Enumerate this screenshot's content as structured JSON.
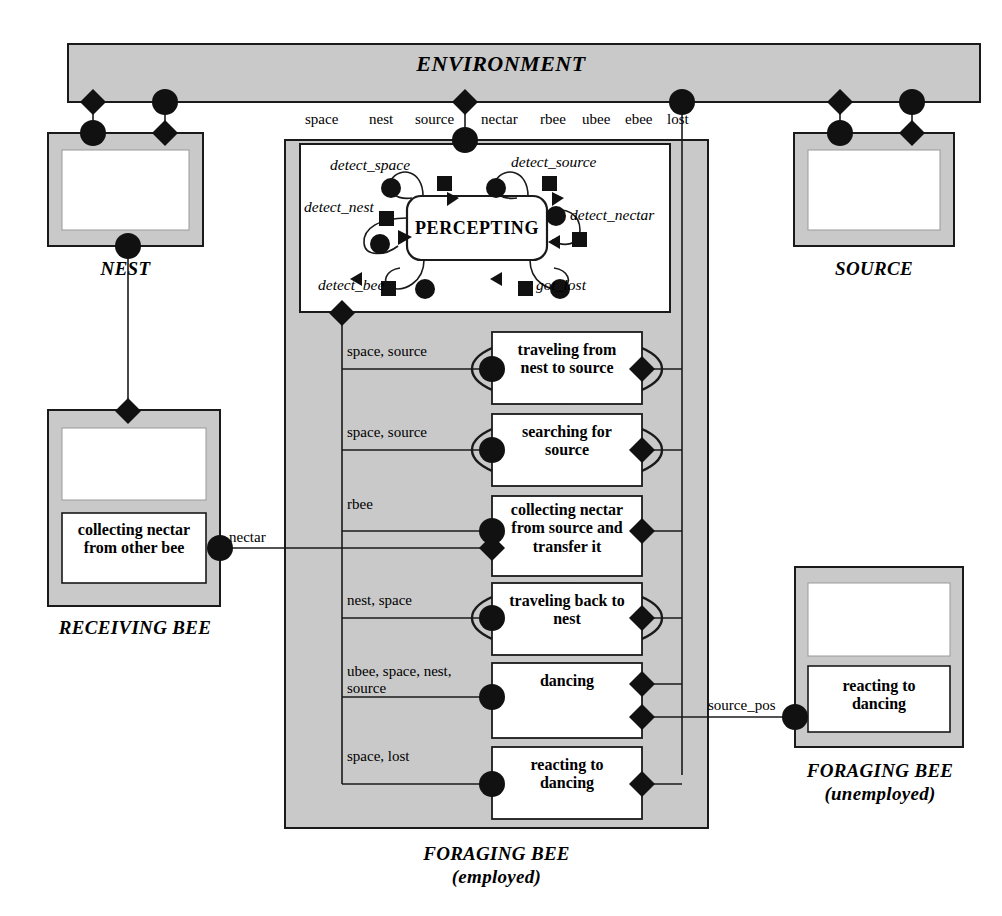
{
  "diagram": {
    "colors": {
      "gray_fill": "#c9c9c9",
      "stroke": "#1a1a1a",
      "white": "#ffffff"
    }
  },
  "environment": {
    "title": "ENVIRONMENT"
  },
  "ports_bar": {
    "items": [
      "space",
      "nest",
      "source",
      "nectar",
      "rbee",
      "ubee",
      "ebee",
      "lost"
    ]
  },
  "entities": {
    "nest": {
      "caption": "NEST"
    },
    "source": {
      "caption": "SOURCE"
    },
    "receiving_bee": {
      "caption": "RECEIVING BEE",
      "activity": "collecting nectar\nfrom other bee"
    },
    "foraging_bee_employed": {
      "caption_line1": "FORAGING BEE",
      "caption_line2": "(employed)"
    },
    "foraging_bee_unemployed": {
      "caption_line1": "FORAGING BEE",
      "caption_line2": "(unemployed)",
      "activity": "reacting to\ndancing"
    }
  },
  "percepting": {
    "name": "PERCEPTING",
    "transitions": [
      {
        "id": "detect_space",
        "label": "detect_space"
      },
      {
        "id": "detect_source",
        "label": "detect_source"
      },
      {
        "id": "detect_nest",
        "label": "detect_nest"
      },
      {
        "id": "detect_nectar",
        "label": "detect_nectar"
      },
      {
        "id": "detect_bee",
        "label": "detect_bee"
      },
      {
        "id": "got_lost",
        "label": "got_lost"
      }
    ]
  },
  "activities": [
    {
      "id": "traveling-from-nest-to-source",
      "label": "traveling from\nnest to source",
      "inputs": "space, source",
      "elliptical": true
    },
    {
      "id": "searching-for-source",
      "label": "searching for\nsource",
      "inputs": "space, source",
      "elliptical": true
    },
    {
      "id": "collecting-nectar-from-source",
      "label": "collecting nectar\nfrom source and\ntransfer it",
      "inputs": "rbee",
      "elliptical": false
    },
    {
      "id": "traveling-back-to-nest",
      "label": "traveling back to\nnest",
      "inputs": "nest, space",
      "elliptical": true
    },
    {
      "id": "dancing",
      "label": "dancing",
      "inputs": "ubee, space, nest,\nsource",
      "elliptical": false
    },
    {
      "id": "reacting-to-dancing",
      "label": "reacting to\ndancing",
      "inputs": "space, lost",
      "elliptical": false
    }
  ],
  "edge_labels": {
    "nectar": "nectar",
    "source_pos": "source_pos"
  }
}
